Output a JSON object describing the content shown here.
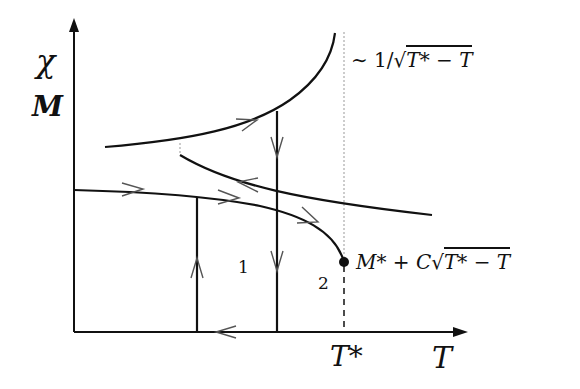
{
  "axes": {
    "y_label_chi": "χ",
    "y_label_m": "M",
    "x_label": "T",
    "x_tick_label": "T*"
  },
  "annotations": {
    "divergence": "~ 1/√(T* − T)",
    "divergence_prefix": "∼ 1/√",
    "divergence_radicand": "T* − T",
    "critical": "M* + C√(T* − T)",
    "critical_prefix": "M* + C√",
    "critical_radicand": "T* − T",
    "path_1": "1",
    "path_2": "2"
  },
  "colors": {
    "line": "#111111",
    "arrow": "#555555",
    "dotted": "#999999"
  }
}
